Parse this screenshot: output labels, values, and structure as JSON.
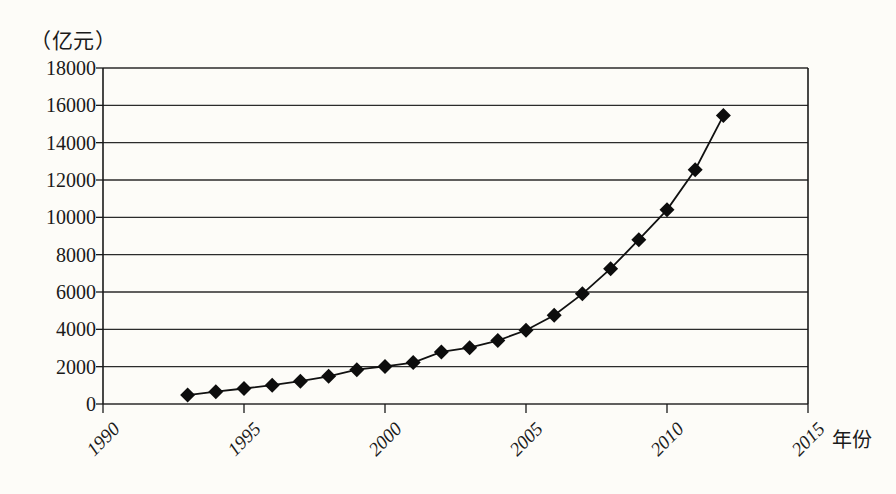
{
  "chart_data": {
    "type": "line",
    "title": "",
    "subtitle": "",
    "unit_label": "（亿元）",
    "xlabel": "年份",
    "ylabel": "",
    "xlim": [
      1990,
      2015
    ],
    "ylim": [
      0,
      18000
    ],
    "grid": true,
    "legend": false,
    "marker": "diamond",
    "x_tick_labels": [
      "1990",
      "1995",
      "2000",
      "2005",
      "2010",
      "2015"
    ],
    "x_tick_values": [
      1990,
      1995,
      2000,
      2005,
      2010,
      2015
    ],
    "y_tick_labels": [
      "0",
      "2000",
      "4000",
      "6000",
      "8000",
      "10000",
      "12000",
      "14000",
      "16000",
      "18000"
    ],
    "y_tick_values": [
      0,
      2000,
      4000,
      6000,
      8000,
      10000,
      12000,
      14000,
      16000,
      18000
    ],
    "x": [
      1993,
      1994,
      1995,
      1996,
      1997,
      1998,
      1999,
      2000,
      2001,
      2002,
      2003,
      2004,
      2005,
      2006,
      2007,
      2008,
      2009,
      2010,
      2011,
      2012
    ],
    "values": [
      480,
      660,
      830,
      1010,
      1220,
      1480,
      1840,
      2010,
      2220,
      2790,
      3020,
      3400,
      3950,
      4750,
      5900,
      7250,
      8800,
      10400,
      12550,
      15450
    ],
    "series": [
      {
        "name": "",
        "values": [
          480,
          660,
          830,
          1010,
          1220,
          1480,
          1840,
          2010,
          2220,
          2790,
          3020,
          3400,
          3950,
          4750,
          5900,
          7250,
          8800,
          10400,
          12550,
          15450
        ]
      }
    ],
    "colors": {
      "line": "#111111",
      "marker": "#0d0d0d",
      "grid": "#2b2b2b",
      "axis": "#1a1a1a",
      "background": "#fdfcf8"
    }
  }
}
